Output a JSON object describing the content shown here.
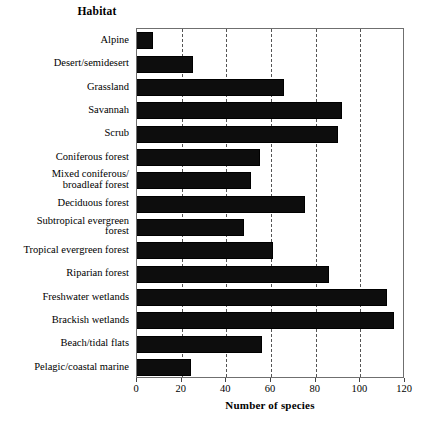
{
  "chart_data": {
    "type": "bar",
    "orientation": "horizontal",
    "title": "Habitat",
    "xlabel": "Number of species",
    "ylabel": "Habitat",
    "xlim": [
      0,
      120
    ],
    "xticks": [
      0,
      20,
      40,
      60,
      80,
      100,
      120
    ],
    "xtick_labels": [
      "0",
      "20",
      "40",
      "60",
      "80",
      "100",
      "120"
    ],
    "grid": "vertical dashed at each x tick",
    "legend": "none",
    "bar_color": "#0d0d0d",
    "categories": [
      "Alpine",
      "Desert/semidesert",
      "Grassland",
      "Savannah",
      "Scrub",
      "Coniferous forest",
      "Mixed coniferous/ broadleaf forest",
      "Deciduous forest",
      "Subtropical evergreen forest",
      "Tropical evergreen forest",
      "Riparian forest",
      "Freshwater wetlands",
      "Brackish wetlands",
      "Beach/tidal flats",
      "Pelagic/coastal marine"
    ],
    "category_lines": [
      [
        "Alpine"
      ],
      [
        "Desert/semidesert"
      ],
      [
        "Grassland"
      ],
      [
        "Savannah"
      ],
      [
        "Scrub"
      ],
      [
        "Coniferous forest"
      ],
      [
        "Mixed coniferous/",
        "broadleaf forest"
      ],
      [
        "Deciduous forest"
      ],
      [
        "Subtropical evergreen",
        "forest"
      ],
      [
        "Tropical evergreen forest"
      ],
      [
        "Riparian forest"
      ],
      [
        "Freshwater wetlands"
      ],
      [
        "Brackish wetlands"
      ],
      [
        "Beach/tidal flats"
      ],
      [
        "Pelagic/coastal marine"
      ]
    ],
    "values": [
      7,
      25,
      66,
      92,
      90,
      55,
      51,
      75,
      48,
      61,
      86,
      112,
      115,
      56,
      24
    ]
  }
}
